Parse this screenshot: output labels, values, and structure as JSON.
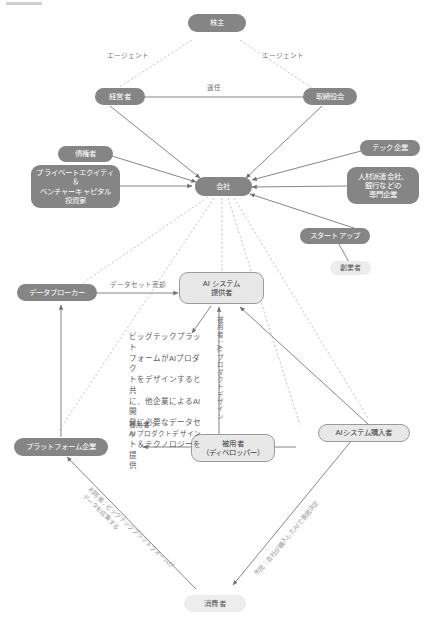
{
  "diagram": {
    "nodes": {
      "shareholders": "株主",
      "management": "経営者",
      "board": "取締役会",
      "creditors": "債権者",
      "pe_vc": "プライベートエクイティ\n＆\nベンチャーキャピタル\n投資家",
      "company": "会社",
      "tech_firms": "テック企業",
      "specialist_firms": "人材派遣会社、\n銀行などの\n専門企業",
      "startups": "スタートアップ",
      "founders": "創業者",
      "data_broker": "データブローカー",
      "ai_system_provider": "AI システム\n提供者",
      "platform_companies": "プラットフォーム企業",
      "employee_developer": "被用者\n（ディベロッパー）",
      "ai_system_purchaser": "AIシステム購入者",
      "consumers": "消費者"
    },
    "edge_labels": {
      "agent_left": "エージェント",
      "agent_right": "エージェント",
      "appointment": "選任",
      "dataset_sale": "データセット売却",
      "employee_ai_product_design": "被用者：\nAI プロダクトデザイン",
      "employee_ai_product_design_vertical": "被用者：AI プロダクトデザイン",
      "bigtech_note": "ビッグテックプラット\nフォームがAIプロダク\nトをデザインすると共\nに、他企業によるAI開\n発に必要なデータセッ\nト＆テクノロジーを提\n供",
      "user_bigtech_collects": "利用者：ビッグテックプラットフォームが\nデータを収集する",
      "citizen_ai_decision": "市民：会社が購入したAIで意思決定"
    },
    "colors": {
      "node_fill_dark": "#8a8a8a",
      "node_fill_pale": "#e8e8e8",
      "node_fill_plain": "#ededed",
      "node_text_light": "#ffffff",
      "node_text_dark": "#3a3a3a",
      "edge_solid": "#707070",
      "edge_dashed": "#b5b5b5",
      "label_text": "#6f6f6f",
      "background": "#ffffff"
    }
  }
}
